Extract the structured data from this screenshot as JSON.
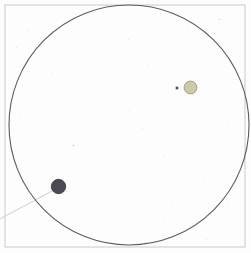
{
  "figure": {
    "kind": "telescope-field-sketch",
    "background_color": "#ffffff",
    "paper_tint": "#fdfdfd"
  },
  "frame": {
    "label": "plate-border",
    "x": 5,
    "y": 5,
    "width": 240,
    "height": 242,
    "stroke_color": "#c9c9cd",
    "stroke_width": 1
  },
  "field_circle": {
    "label": "field-of-view-circle",
    "cx": 129,
    "cy": 125,
    "r": 120,
    "stroke_color": "#5b5b63",
    "stroke_width": 1.1,
    "fill": "none"
  },
  "objects": [
    {
      "name": "dark-disc",
      "cx": 58.5,
      "cy": 186.5,
      "r": 7.2,
      "fill": "#4a4a52",
      "stroke": "#33333a",
      "stroke_width": 0.8
    },
    {
      "name": "olive-disc",
      "cx": 190.5,
      "cy": 87.5,
      "r": 6.4,
      "fill": "#cfc9a8",
      "stroke": "#9d9a7e",
      "stroke_width": 0.9
    }
  ],
  "trail": {
    "name": "motion-trail-line",
    "x1": 54.0,
    "y1": 190.0,
    "x2": -4.0,
    "y2": 221.0,
    "stroke_color": "#cfcfd4",
    "stroke_width": 1.0
  },
  "marker_dot": {
    "name": "companion-marker",
    "cx": 177.0,
    "cy": 88.0,
    "size": 2.6,
    "fill": "#4e4e57"
  },
  "speckles": {
    "name": "star-field-speckles",
    "default_fill": "#b9b9c2",
    "points": [
      {
        "x": 28.5,
        "y": 31.5,
        "r": 0.55,
        "o": 0.45
      },
      {
        "x": 76.0,
        "y": 14.5,
        "r": 0.55,
        "o": 0.4
      },
      {
        "x": 105.5,
        "y": 22.0,
        "r": 0.5,
        "o": 0.35
      },
      {
        "x": 146.5,
        "y": 16.0,
        "r": 0.6,
        "o": 0.5
      },
      {
        "x": 188.5,
        "y": 24.5,
        "r": 0.5,
        "o": 0.35
      },
      {
        "x": 219.5,
        "y": 19.5,
        "r": 0.75,
        "o": 0.65
      },
      {
        "x": 233.0,
        "y": 12.5,
        "r": 0.45,
        "o": 0.3
      },
      {
        "x": 28.0,
        "y": 29.0,
        "r": 0.5,
        "o": 0.35
      },
      {
        "x": 16.5,
        "y": 47.5,
        "r": 0.55,
        "o": 0.4
      },
      {
        "x": 44.5,
        "y": 41.0,
        "r": 0.5,
        "o": 0.3
      },
      {
        "x": 68.0,
        "y": 48.0,
        "r": 0.55,
        "o": 0.42
      },
      {
        "x": 97.0,
        "y": 50.0,
        "r": 0.5,
        "o": 0.32
      },
      {
        "x": 128.5,
        "y": 39.5,
        "r": 0.55,
        "o": 0.4
      },
      {
        "x": 160.0,
        "y": 48.5,
        "r": 0.5,
        "o": 0.35
      },
      {
        "x": 196.5,
        "y": 50.0,
        "r": 0.5,
        "o": 0.32
      },
      {
        "x": 226.5,
        "y": 52.0,
        "r": 0.55,
        "o": 0.4
      },
      {
        "x": 22.5,
        "y": 69.0,
        "r": 0.5,
        "o": 0.35
      },
      {
        "x": 52.5,
        "y": 73.0,
        "r": 0.55,
        "o": 0.38
      },
      {
        "x": 66.0,
        "y": 64.5,
        "r": 0.45,
        "o": 0.28
      },
      {
        "x": 84.0,
        "y": 66.5,
        "r": 0.5,
        "o": 0.33
      },
      {
        "x": 110.0,
        "y": 69.0,
        "r": 0.5,
        "o": 0.35
      },
      {
        "x": 148.0,
        "y": 65.0,
        "r": 0.55,
        "o": 0.4
      },
      {
        "x": 171.5,
        "y": 77.0,
        "r": 0.45,
        "o": 0.28
      },
      {
        "x": 210.0,
        "y": 72.5,
        "r": 0.5,
        "o": 0.33
      },
      {
        "x": 238.5,
        "y": 73.0,
        "r": 0.5,
        "o": 0.35
      },
      {
        "x": 12.5,
        "y": 89.0,
        "r": 0.5,
        "o": 0.32
      },
      {
        "x": 38.0,
        "y": 99.0,
        "r": 0.55,
        "o": 0.4
      },
      {
        "x": 63.0,
        "y": 92.0,
        "r": 0.45,
        "o": 0.27
      },
      {
        "x": 88.0,
        "y": 101.5,
        "r": 0.55,
        "o": 0.42
      },
      {
        "x": 116.5,
        "y": 96.0,
        "r": 0.5,
        "o": 0.33
      },
      {
        "x": 129.0,
        "y": 111.0,
        "r": 0.55,
        "o": 0.38
      },
      {
        "x": 155.0,
        "y": 104.5,
        "r": 0.45,
        "o": 0.28
      },
      {
        "x": 178.0,
        "y": 99.5,
        "r": 0.5,
        "o": 0.33
      },
      {
        "x": 202.5,
        "y": 95.5,
        "r": 0.5,
        "o": 0.35
      },
      {
        "x": 234.0,
        "y": 102.5,
        "r": 0.55,
        "o": 0.4
      },
      {
        "x": 20.0,
        "y": 118.5,
        "r": 0.5,
        "o": 0.32
      },
      {
        "x": 46.0,
        "y": 126.0,
        "r": 0.55,
        "o": 0.4
      },
      {
        "x": 72.0,
        "y": 129.5,
        "r": 0.5,
        "o": 0.33
      },
      {
        "x": 97.0,
        "y": 124.0,
        "r": 0.45,
        "o": 0.27
      },
      {
        "x": 113.0,
        "y": 132.0,
        "r": 0.5,
        "o": 0.35
      },
      {
        "x": 142.5,
        "y": 128.5,
        "r": 0.55,
        "o": 0.4
      },
      {
        "x": 165.0,
        "y": 121.5,
        "r": 0.45,
        "o": 0.28
      },
      {
        "x": 171.0,
        "y": 137.0,
        "r": 0.5,
        "o": 0.33
      },
      {
        "x": 200.0,
        "y": 130.0,
        "r": 0.55,
        "o": 0.42
      },
      {
        "x": 228.0,
        "y": 124.0,
        "r": 0.5,
        "o": 0.35
      },
      {
        "x": 73.5,
        "y": 145.5,
        "r": 0.85,
        "o": 0.7
      },
      {
        "x": 16.0,
        "y": 151.5,
        "r": 0.5,
        "o": 0.33
      },
      {
        "x": 40.0,
        "y": 158.0,
        "r": 0.5,
        "o": 0.32
      },
      {
        "x": 93.5,
        "y": 152.0,
        "r": 0.5,
        "o": 0.35
      },
      {
        "x": 120.0,
        "y": 147.5,
        "r": 0.45,
        "o": 0.27
      },
      {
        "x": 134.0,
        "y": 160.0,
        "r": 0.5,
        "o": 0.35
      },
      {
        "x": 163.5,
        "y": 156.0,
        "r": 0.55,
        "o": 0.4
      },
      {
        "x": 190.0,
        "y": 151.5,
        "r": 0.45,
        "o": 0.28
      },
      {
        "x": 216.0,
        "y": 158.0,
        "r": 0.5,
        "o": 0.33
      },
      {
        "x": 240.0,
        "y": 150.5,
        "r": 0.5,
        "o": 0.32
      },
      {
        "x": 26.0,
        "y": 178.0,
        "r": 0.5,
        "o": 0.33
      },
      {
        "x": 85.0,
        "y": 176.5,
        "r": 0.45,
        "o": 0.28
      },
      {
        "x": 104.0,
        "y": 182.0,
        "r": 0.5,
        "o": 0.35
      },
      {
        "x": 126.5,
        "y": 175.0,
        "r": 0.5,
        "o": 0.32
      },
      {
        "x": 150.0,
        "y": 184.0,
        "r": 0.55,
        "o": 0.4
      },
      {
        "x": 177.0,
        "y": 176.0,
        "r": 0.45,
        "o": 0.27
      },
      {
        "x": 203.5,
        "y": 181.0,
        "r": 0.5,
        "o": 0.33
      },
      {
        "x": 232.0,
        "y": 176.5,
        "r": 0.5,
        "o": 0.35
      },
      {
        "x": 36.0,
        "y": 199.0,
        "r": 0.5,
        "o": 0.32
      },
      {
        "x": 69.0,
        "y": 203.0,
        "r": 0.5,
        "o": 0.33
      },
      {
        "x": 95.0,
        "y": 196.5,
        "r": 0.45,
        "o": 0.27
      },
      {
        "x": 119.0,
        "y": 205.0,
        "r": 0.5,
        "o": 0.35
      },
      {
        "x": 144.0,
        "y": 198.0,
        "r": 0.5,
        "o": 0.32
      },
      {
        "x": 172.5,
        "y": 202.5,
        "r": 0.5,
        "o": 0.33
      },
      {
        "x": 199.0,
        "y": 197.0,
        "r": 0.45,
        "o": 0.28
      },
      {
        "x": 228.0,
        "y": 203.5,
        "r": 0.5,
        "o": 0.35
      },
      {
        "x": 49.0,
        "y": 220.5,
        "r": 0.5,
        "o": 0.33
      },
      {
        "x": 78.0,
        "y": 224.0,
        "r": 0.45,
        "o": 0.27
      },
      {
        "x": 107.0,
        "y": 218.0,
        "r": 0.5,
        "o": 0.33
      },
      {
        "x": 136.0,
        "y": 226.0,
        "r": 0.5,
        "o": 0.32
      },
      {
        "x": 164.0,
        "y": 219.5,
        "r": 0.5,
        "o": 0.35
      },
      {
        "x": 193.0,
        "y": 225.0,
        "r": 0.45,
        "o": 0.28
      },
      {
        "x": 221.5,
        "y": 217.5,
        "r": 0.5,
        "o": 0.33
      },
      {
        "x": 116.0,
        "y": 240.0,
        "r": 0.5,
        "o": 0.32
      },
      {
        "x": 158.0,
        "y": 243.0,
        "r": 0.45,
        "o": 0.27
      },
      {
        "x": 207.0,
        "y": 239.5,
        "r": 0.55,
        "o": 0.4
      },
      {
        "x": 241.0,
        "y": 234.0,
        "r": 0.5,
        "o": 0.33
      }
    ]
  }
}
